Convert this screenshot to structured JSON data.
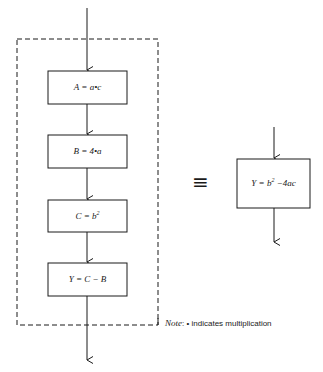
{
  "diagram": {
    "left_flow": {
      "steps": [
        {
          "lhs": "A",
          "rhs": "a•c"
        },
        {
          "lhs": "B",
          "rhs": "4•a"
        },
        {
          "lhs": "C",
          "rhs": "b",
          "rhs_sup": "2"
        },
        {
          "lhs": "Y",
          "rhs": "C − B"
        }
      ]
    },
    "equivalence_symbol": "≡",
    "right_flow": {
      "step": {
        "lhs": "Y",
        "rhs_base": "b",
        "rhs_sup": "2",
        "rhs_tail": "−4ac"
      }
    },
    "note": {
      "label": "Note",
      "separator": ":",
      "bullet": "•",
      "text": "indicates multiplication"
    }
  }
}
